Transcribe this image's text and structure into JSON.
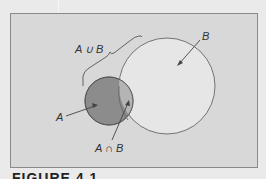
{
  "figure": {
    "caption": "FIGURE 4.1",
    "background_color": "#d8d8d8",
    "set_a_color": "#8c8c8c",
    "intersection_color": "#b4b4b4",
    "set_b_color": "#e6e6e6"
  },
  "labels": {
    "union": "A ∪ B",
    "set_b": "B",
    "set_a": "A",
    "intersection": "A ∩ B"
  }
}
